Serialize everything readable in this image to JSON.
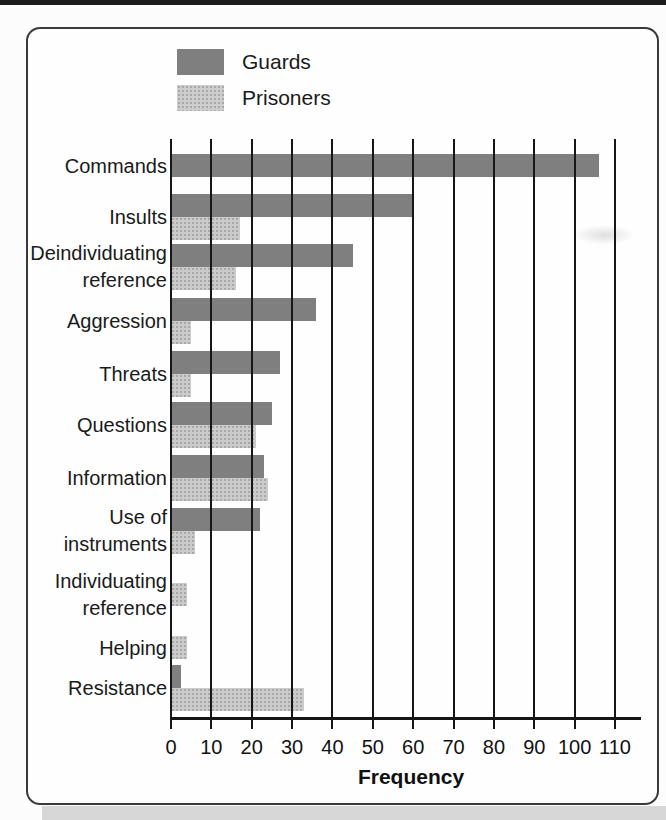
{
  "chart_data": {
    "type": "bar",
    "orientation": "horizontal",
    "title": "",
    "xlabel": "Frequency",
    "categories": [
      "Commands",
      "Insults",
      "Deindividuating\nreference",
      "Aggression",
      "Threats",
      "Questions",
      "Information",
      "Use of\ninstruments",
      "Individuating\nreference",
      "Helping",
      "Resistance"
    ],
    "series": [
      {
        "name": "Guards",
        "color": "#7f7f7f",
        "values": [
          106,
          60,
          45,
          36,
          27,
          25,
          23,
          22,
          0,
          0,
          2.5
        ]
      },
      {
        "name": "Prisoners",
        "color": "#cbcbcb",
        "values": [
          0,
          17,
          16,
          5,
          5,
          21,
          24,
          6,
          4,
          4,
          33
        ]
      }
    ],
    "x_ticks": [
      0,
      10,
      20,
      30,
      40,
      50,
      60,
      70,
      80,
      90,
      100,
      110
    ],
    "xlim": [
      0,
      117
    ],
    "grid": "vertical",
    "legend_position": "top-left",
    "gridline_color": "#161616"
  }
}
